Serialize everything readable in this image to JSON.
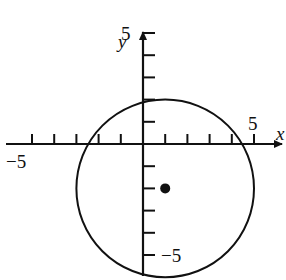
{
  "figure": {
    "axes": {
      "x_label": "x",
      "y_label": "y",
      "x_range": [
        -5.5,
        6
      ],
      "y_range": [
        -5.8,
        6
      ],
      "x_ticks": [
        -5,
        -4,
        -3,
        -2,
        -1,
        1,
        2,
        3,
        4,
        5
      ],
      "y_ticks": [
        -5,
        -4,
        -3,
        -2,
        -1,
        1,
        2,
        3,
        4,
        5
      ],
      "x_tick_labels": [
        {
          "value": -5,
          "text": "−5"
        },
        {
          "value": 5,
          "text": "5"
        }
      ],
      "y_tick_labels": [
        {
          "value": 5,
          "text": "5"
        },
        {
          "value": -5,
          "text": "−5"
        }
      ]
    },
    "circle": {
      "center": [
        1,
        -2
      ],
      "radius": 4
    },
    "point": {
      "x": 1,
      "y": -2
    },
    "color": "#111111"
  }
}
